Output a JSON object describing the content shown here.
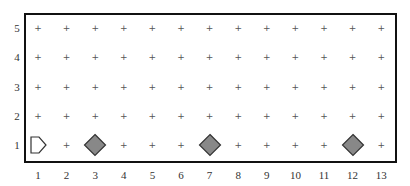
{
  "board": {
    "columns": 13,
    "rows": 5,
    "x_labels": [
      "1",
      "2",
      "3",
      "4",
      "5",
      "6",
      "7",
      "8",
      "9",
      "10",
      "11",
      "12",
      "13"
    ],
    "y_labels": [
      "1",
      "2",
      "3",
      "4",
      "5"
    ],
    "grid_glyph": "+"
  },
  "pieces": [
    {
      "type": "pentagon-arrow",
      "icon": "start-pointer-icon",
      "col": 1,
      "row": 1,
      "fill": "#ffffff",
      "stroke": "#333333"
    },
    {
      "type": "diamond",
      "icon": "diamond-icon",
      "col": 3,
      "row": 1,
      "fill": "#888888",
      "stroke": "#333333"
    },
    {
      "type": "diamond",
      "icon": "diamond-icon",
      "col": 7,
      "row": 1,
      "fill": "#888888",
      "stroke": "#333333"
    },
    {
      "type": "diamond",
      "icon": "diamond-icon",
      "col": 12,
      "row": 1,
      "fill": "#888888",
      "stroke": "#333333"
    }
  ],
  "colors": {
    "frame": "#111111",
    "grid_plus": "#555555",
    "label": "#333333",
    "diamond_fill": "#888888"
  }
}
